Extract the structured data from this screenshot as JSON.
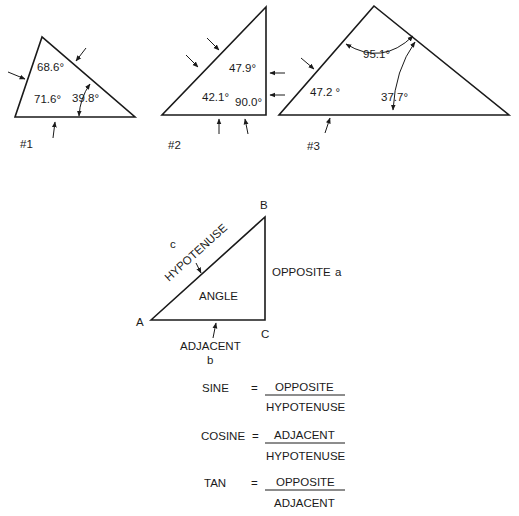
{
  "triangles": [
    {
      "id": "#1",
      "angles": [
        "68.6°",
        "71.6°",
        "39.8°"
      ]
    },
    {
      "id": "#2",
      "angles": [
        "47.9°",
        "42.1°",
        "90.0°"
      ]
    },
    {
      "id": "#3",
      "angles": [
        "95.1°",
        "47.2 °",
        "37.7°"
      ]
    }
  ],
  "reference_triangle": {
    "vertices": {
      "a": "A",
      "b": "B",
      "c": "C"
    },
    "sides": {
      "hypotenuse": "HYPOTENUSE",
      "hypotenuse_letter": "c",
      "opposite": "OPPOSITE",
      "opposite_letter": "a",
      "adjacent": "ADJACENT",
      "adjacent_letter": "b"
    },
    "angle_label": "ANGLE"
  },
  "formulas": [
    {
      "name": "SINE",
      "equals": "=",
      "numerator": "OPPOSITE",
      "denominator": "HYPOTENUSE"
    },
    {
      "name": "COSINE",
      "equals": "=",
      "numerator": "ADJACENT",
      "denominator": "HYPOTENUSE"
    },
    {
      "name": "TAN",
      "equals": "=",
      "numerator": "OPPOSITE",
      "denominator": "ADJACENT"
    }
  ]
}
